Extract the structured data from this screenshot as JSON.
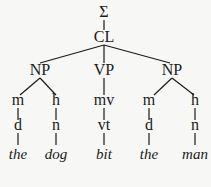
{
  "tree": {
    "root": "Σ",
    "clause": "CL",
    "phrases": [
      "NP",
      "VP",
      "NP"
    ],
    "functions": [
      "m",
      "h",
      "mv",
      "m",
      "h"
    ],
    "classes": [
      "d",
      "n",
      "vt",
      "d",
      "n"
    ],
    "words": [
      "the",
      "dog",
      "bit",
      "the",
      "man"
    ]
  }
}
